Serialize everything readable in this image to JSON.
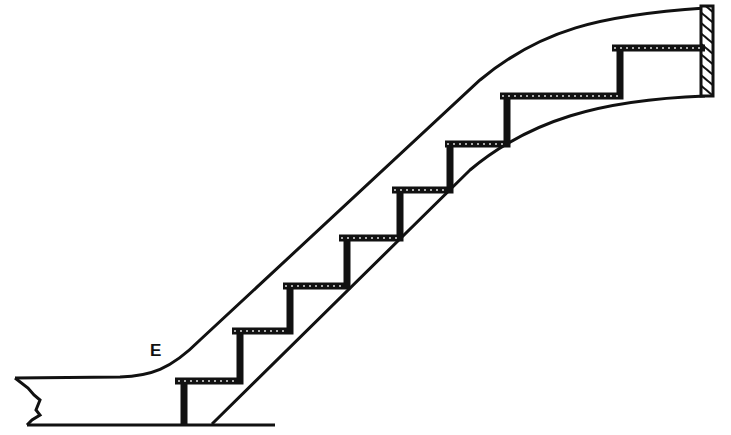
{
  "diagram": {
    "type": "escalator cross-section line drawing",
    "labels": {
      "e": "E"
    },
    "colors": {
      "ink": "#111111",
      "background": "#ffffff",
      "tread_dots": "#dddddd"
    },
    "steps_count": 8
  }
}
